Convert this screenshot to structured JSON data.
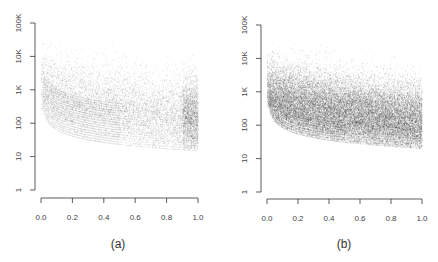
{
  "chart_data": [
    {
      "type": "scatter",
      "panel": "(a)",
      "title": "",
      "xlabel": "",
      "ylabel": "",
      "x_ticks": [
        "0.0",
        "0.2",
        "0.4",
        "0.6",
        "0.8",
        "1.0"
      ],
      "y_ticks": [
        "1",
        "10",
        "100",
        "1K",
        "10K",
        "100K"
      ],
      "xlim": [
        0.0,
        1.0
      ],
      "ylim": [
        1,
        100000
      ],
      "y_scale": "log",
      "grid": false,
      "legend": null,
      "description": "Dense scatter on log y-axis; lower bound formed by a family of hyperbolic curves y = k/x descending from ~2K near x=0 to ~15-60 at x=1; point cloud centered around ~100-500, densest near x=1.0",
      "density": "light",
      "n_curves": 18,
      "curve_min_at_x1": 15,
      "cloud_center_at_x0": 1000,
      "cloud_center_at_x1": 150,
      "cloud_spread_decades": 0.6,
      "n_points": 9000
    },
    {
      "type": "scatter",
      "panel": "(b)",
      "title": "",
      "xlabel": "",
      "ylabel": "",
      "x_ticks": [
        "0.0",
        "0.2",
        "0.4",
        "0.6",
        "0.8",
        "1.0"
      ],
      "y_ticks": [
        "1",
        "10",
        "100",
        "1K",
        "10K",
        "100K"
      ],
      "xlim": [
        0.0,
        1.0
      ],
      "ylim": [
        1,
        100000
      ],
      "y_scale": "log",
      "grid": false,
      "legend": null,
      "description": "Much denser scatter on log y-axis; lower bound formed by hyperbolic curves from ~2K near x=0 down to ~20-40 at x=1; dark cloud centered ~100-300 across x, spreading up to ~10K",
      "density": "heavy",
      "n_curves": 10,
      "curve_min_at_x1": 20,
      "cloud_center_at_x0": 800,
      "cloud_center_at_x1": 120,
      "cloud_spread_decades": 0.55,
      "n_points": 26000
    }
  ],
  "panels": [
    {
      "caption": "(a)"
    },
    {
      "caption": "(b)"
    }
  ],
  "axis": {
    "x_ticks": [
      "0.0",
      "0.2",
      "0.4",
      "0.6",
      "0.8",
      "1.0"
    ],
    "y_ticks": [
      "1",
      "10",
      "100",
      "1K",
      "10K",
      "100K"
    ]
  },
  "colors": {
    "points": "#000000",
    "axis": "#333333",
    "text": "#444444",
    "background": "#ffffff"
  }
}
